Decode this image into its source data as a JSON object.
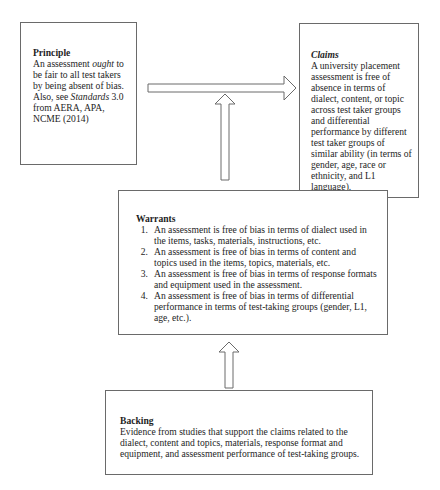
{
  "diagram": {
    "type": "Toulmin argument structure",
    "nodes": {
      "principle": {
        "title": "Principle",
        "text_parts": [
          {
            "text": "An assessment ",
            "style": "normal"
          },
          {
            "text": "ought",
            "style": "italic"
          },
          {
            "text": " to be fair to all test takers by being absent of bias. Also, see ",
            "style": "normal"
          },
          {
            "text": "Standards",
            "style": "italic"
          },
          {
            "text": " 3.0 from AERA, APA, NCME (2014)",
            "style": "normal"
          }
        ]
      },
      "claims": {
        "title": "Claims",
        "text": "A university placement assessment is free of absence in terms of dialect, content, or topic across test taker groups and differential performance by different test taker groups of similar ability (in terms of gender, age, race or ethnicity, and L1 language)."
      },
      "warrants": {
        "title": "Warrants",
        "items": [
          {
            "num": "1.",
            "text": "An assessment is free of bias in terms of dialect used in the items, tasks, materials, instructions, etc."
          },
          {
            "num": "2.",
            "text": "An assessment is free of bias in terms of content and topics used in the items, topics, materials, etc."
          },
          {
            "num": "3.",
            "text": "An assessment is free of bias in terms of response formats and equipment used in the assessment."
          },
          {
            "num": "4.",
            "text": "An assessment is free of bias in terms of differential performance in terms of test-taking groups (gender, L1, age, etc.)."
          }
        ]
      },
      "backing": {
        "title": "Backing",
        "text": "Evidence from studies that support the claims related to the dialect, content and topics, materials, response format and equipment, and assessment performance of test-taking groups."
      }
    },
    "edges": [
      {
        "from": "principle",
        "to": "claims",
        "direction": "right",
        "style": "block-arrow"
      },
      {
        "from": "warrants",
        "to": "claims-arrow",
        "direction": "up",
        "style": "block-arrow"
      },
      {
        "from": "backing",
        "to": "warrants",
        "direction": "up",
        "style": "block-arrow"
      }
    ],
    "colors": {
      "border": "#6a6a6a",
      "text": "#1e1e1e",
      "background": "#ffffff"
    }
  }
}
